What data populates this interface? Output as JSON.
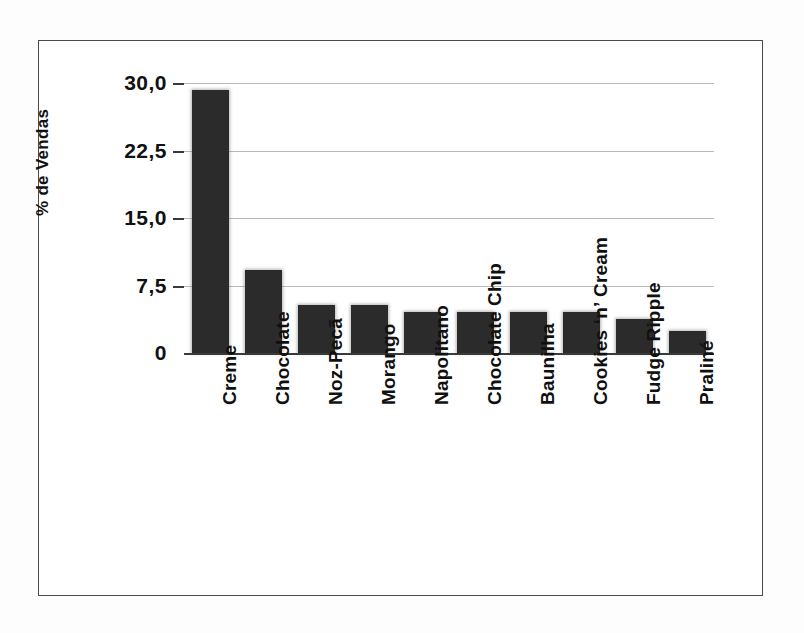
{
  "chart_data": {
    "type": "bar",
    "title": "",
    "subtitle": "",
    "xlabel": "",
    "ylabel": "% de Vendas",
    "ylim": [
      0,
      30
    ],
    "grid": true,
    "legend": null,
    "orientation": "vertical",
    "bar_color": "#2b2b2b",
    "gridline_color": "#b9b9b9",
    "axis_color": "#3a3a3a",
    "frame_color": "#4a4a4a",
    "background_color": "#ffffff",
    "decimal_separator": ",",
    "ytick_labels": [
      "30,0",
      "22,5",
      "15,0",
      "7,5",
      "0"
    ],
    "ytick_values": [
      30.0,
      22.5,
      15.0,
      7.5,
      0
    ],
    "categories": [
      "Creme",
      "Chocolate",
      "Noz-Pecã",
      "Morango",
      "Napolitano",
      "Chocolate Chip",
      "Baunilha",
      "Cookies ‘n’ Cream",
      "Fudge Ripple",
      "Praliné"
    ],
    "values": [
      29.2,
      9.2,
      5.3,
      5.3,
      4.6,
      4.6,
      4.6,
      4.6,
      3.8,
      2.4
    ]
  }
}
